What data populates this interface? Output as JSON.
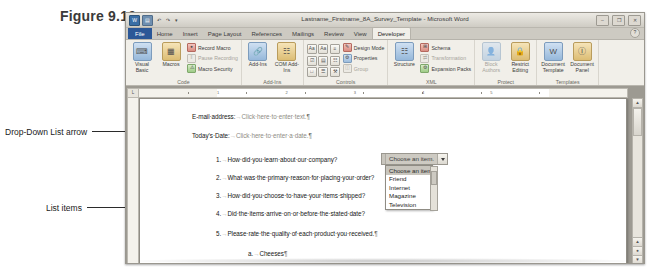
{
  "figure": {
    "label": "Figure 9.10"
  },
  "callouts": [
    {
      "id": "dropdown-arrow",
      "text": "Drop-Down List arrow"
    },
    {
      "id": "list-items",
      "text": "List items"
    }
  ],
  "window": {
    "title": "Lastname_Firstname_8A_Survey_Template - Microsoft Word",
    "quick_access": [
      {
        "name": "word-logo-icon",
        "glyph": "W"
      },
      {
        "name": "save-icon",
        "glyph": "▤"
      },
      {
        "name": "undo-icon",
        "glyph": "↶"
      },
      {
        "name": "redo-icon",
        "glyph": "↷"
      },
      {
        "name": "customize-qat-icon",
        "glyph": "▾"
      }
    ],
    "controls": [
      {
        "name": "minimize-button",
        "glyph": "–"
      },
      {
        "name": "restore-button",
        "glyph": "❐"
      },
      {
        "name": "close-button",
        "glyph": "✕"
      }
    ],
    "help_icon": "?"
  },
  "ribbon": {
    "tabs": [
      {
        "label": "File",
        "active": false,
        "style": "file"
      },
      {
        "label": "Home",
        "active": false,
        "style": ""
      },
      {
        "label": "Insert",
        "active": false,
        "style": ""
      },
      {
        "label": "Page Layout",
        "active": false,
        "style": ""
      },
      {
        "label": "References",
        "active": false,
        "style": ""
      },
      {
        "label": "Mailings",
        "active": false,
        "style": ""
      },
      {
        "label": "Review",
        "active": false,
        "style": ""
      },
      {
        "label": "View",
        "active": false,
        "style": ""
      },
      {
        "label": "Developer",
        "active": true,
        "style": "active"
      }
    ],
    "groups": [
      {
        "title": "Code",
        "big_buttons": [
          {
            "label": "Visual Basic",
            "icon": "visual-basic-icon",
            "glyph": "⌨"
          },
          {
            "label": "Macros",
            "icon": "macros-icon",
            "glyph": "▦"
          }
        ],
        "small_buttons": [
          {
            "label": "Record Macro",
            "icon": "record-macro-icon",
            "glyph": "●",
            "disabled": false
          },
          {
            "label": "Pause Recording",
            "icon": "pause-recording-icon",
            "glyph": "‖",
            "disabled": true
          },
          {
            "label": "Macro Security",
            "icon": "macro-security-icon",
            "glyph": "⚠",
            "disabled": false
          }
        ]
      },
      {
        "title": "Add-Ins",
        "big_buttons": [
          {
            "label": "Add-Ins",
            "icon": "add-ins-icon",
            "glyph": "🔗"
          },
          {
            "label": "COM Add-Ins",
            "icon": "com-add-ins-icon",
            "glyph": "☷"
          }
        ],
        "small_buttons": []
      },
      {
        "title": "Controls",
        "big_buttons": [],
        "icon_rows": [
          [
            "Aa",
            "Aa",
            "≡"
          ],
          [
            "☑",
            "▤",
            "☷"
          ],
          [
            "□",
            "☰",
            "⚒"
          ]
        ],
        "small_buttons": [
          {
            "label": "Design Mode",
            "icon": "design-mode-icon",
            "glyph": "✎",
            "disabled": false
          },
          {
            "label": "Properties",
            "icon": "properties-icon",
            "glyph": "⚙",
            "disabled": false
          },
          {
            "label": "Group",
            "icon": "group-icon",
            "glyph": "◫",
            "disabled": true
          }
        ]
      },
      {
        "title": "XML",
        "big_buttons": [
          {
            "label": "Structure",
            "icon": "structure-icon",
            "glyph": "☷"
          }
        ],
        "small_buttons": [
          {
            "label": "Schema",
            "icon": "schema-icon",
            "glyph": "⊞",
            "disabled": false
          },
          {
            "label": "Transformation",
            "icon": "transformation-icon",
            "glyph": "⇄",
            "disabled": true
          },
          {
            "label": "Expansion Packs",
            "icon": "expansion-packs-icon",
            "glyph": "⚙",
            "disabled": false
          }
        ]
      },
      {
        "title": "Protect",
        "big_buttons": [
          {
            "label": "Block Authors",
            "icon": "block-authors-icon",
            "glyph": "👤",
            "disabled": true
          },
          {
            "label": "Restrict Editing",
            "icon": "restrict-editing-icon",
            "glyph": "🔒"
          }
        ],
        "small_buttons": []
      },
      {
        "title": "Templates",
        "big_buttons": [
          {
            "label": "Document Template",
            "icon": "document-template-icon",
            "glyph": "W"
          },
          {
            "label": "Document Panel",
            "icon": "document-panel-icon",
            "glyph": "Ⓘ"
          }
        ],
        "small_buttons": []
      }
    ]
  },
  "ruler": {
    "corner_icon": "tab-selector-icon",
    "numbers": [
      "1",
      "2",
      "3",
      "4",
      "5"
    ]
  },
  "document": {
    "lines": [
      {
        "id": "email-address",
        "prefix": "E-mail·address:",
        "arrow": "→",
        "placeholder": "Click·here·to·enter·text.",
        "pilcrow": "¶"
      },
      {
        "id": "todays-date",
        "prefix": "Today’s·Date:",
        "arrow": "→",
        "placeholder": "Click·here·to·enter·a·date.",
        "pilcrow": "¶"
      },
      {
        "id": "question-1",
        "number": "1.",
        "arrow": "→",
        "text": "How·did·you·learn·about·our·company?",
        "pilcrow": "¶"
      },
      {
        "id": "question-2",
        "number": "2.",
        "arrow": "→",
        "text": "What·was·the·primary·reason·for·placing·your·order?",
        "pilcrow": "¶"
      },
      {
        "id": "question-3",
        "number": "3.",
        "arrow": "→",
        "text": "How·did·you·choose·to·have·your·items·shipped?",
        "pilcrow": "¶"
      },
      {
        "id": "question-4",
        "number": "4.",
        "arrow": "→",
        "text": "Did·the·items·arrive·on·or·before·the·stated·date?",
        "pilcrow": "¶"
      },
      {
        "id": "question-5",
        "number": "5.",
        "arrow": "→",
        "text": "Please·rate·the·quality·of·each·product·you·received.",
        "pilcrow": "¶"
      },
      {
        "id": "question-5a",
        "number": "a.",
        "arrow": "→",
        "text": "Cheeses",
        "pilcrow": "¶"
      }
    ]
  },
  "dropdown_control": {
    "selected_text": "Choose an item.",
    "arrow_icon": "chevron-down-icon",
    "items": [
      "Choose an item.",
      "Friend",
      "Internet",
      "Magazine",
      "Television"
    ],
    "selected_index": 0
  },
  "scrollbar": {
    "up_arrow": "▲",
    "down_arrow": "▼",
    "nav_buttons": [
      "▲",
      "●",
      "▼"
    ]
  },
  "colors": {
    "ribbon_bg": "#f1efe9",
    "window_chrome": "#d3d0c8",
    "file_tab": "#2b5797",
    "selection": "#c8c5bd",
    "page_white": "#ffffff"
  }
}
